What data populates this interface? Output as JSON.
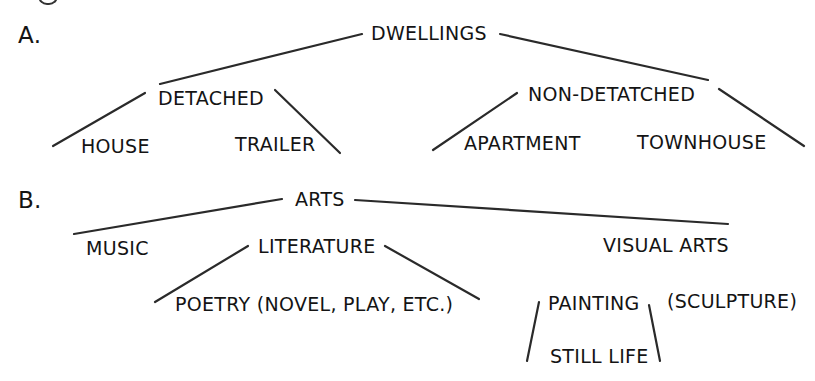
{
  "figure": {
    "sections": [
      {
        "label": "A.",
        "root": "DWELLINGS",
        "children": [
          {
            "label": "DETACHED",
            "children": [
              "HOUSE",
              "TRAILER"
            ]
          },
          {
            "label": "NON-DETATCHED",
            "children": [
              "APARTMENT",
              "TOWNHOUSE"
            ]
          }
        ]
      },
      {
        "label": "B.",
        "root": "ARTS",
        "children": [
          {
            "label": "MUSIC"
          },
          {
            "label": "LITERATURE",
            "children": [
              "POETRY (NOVEL, PLAY, ETC.)"
            ]
          },
          {
            "label": "VISUAL ARTS",
            "children": [
              {
                "label": "PAINTING",
                "children": [
                  "STILL LIFE"
                ]
              },
              {
                "label": "(SCULPTURE)"
              }
            ]
          }
        ]
      }
    ],
    "colors": {
      "ink": "#141414",
      "background": "#ffffff"
    }
  }
}
